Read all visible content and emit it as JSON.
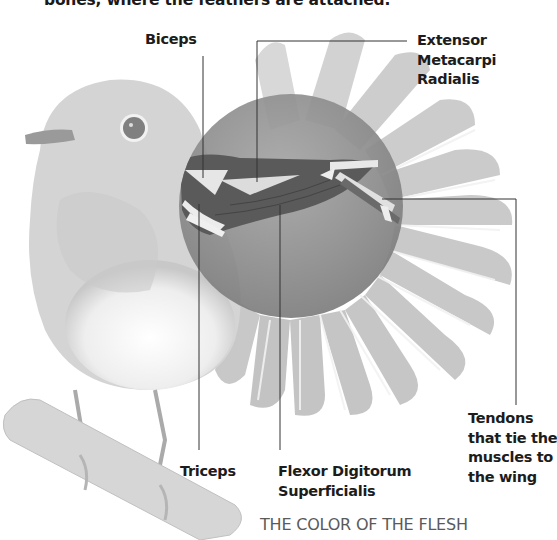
{
  "caption": {
    "top_text": "bones, where the feathers are attached."
  },
  "diagram": {
    "labels": {
      "biceps": [
        "Biceps"
      ],
      "extensor": [
        "Extensor",
        "Metacarpi",
        "Radialis"
      ],
      "tendons": [
        "Tendons",
        "that tie the",
        "muscles to",
        "the wing"
      ],
      "triceps": [
        "Triceps"
      ],
      "flexor": [
        "Flexor Digitorum",
        "Superficialis"
      ]
    }
  },
  "section": {
    "heading": "THE COLOR OF THE FLESH"
  },
  "colors": {
    "text": "#1c1c1c",
    "heading_gray": "#5a5a5a",
    "leader_line": "#333333",
    "bird_gray": "#c8c8c8",
    "lens_gray": "#8a8a8a",
    "muscle_dark": "#555555"
  }
}
